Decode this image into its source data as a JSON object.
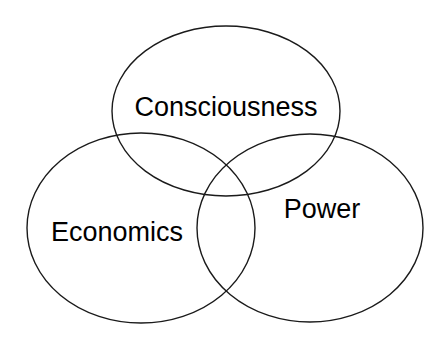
{
  "figure": {
    "type": "venn-diagram",
    "background_color": "#ffffff",
    "stroke_color": "#1a1a1a",
    "text_color": "#000000",
    "set_count": 3,
    "width": 448,
    "height": 347
  },
  "sets": [
    {
      "id": "consciousness",
      "label": "Consciousness",
      "position": "top",
      "center_x": 226,
      "center_y": 111,
      "radius_x": 114,
      "radius_y": 85,
      "label_x": 226,
      "label_y": 109
    },
    {
      "id": "economics",
      "label": "Economics",
      "position": "bottom-left",
      "center_x": 141,
      "center_y": 228,
      "radius_x": 114,
      "radius_y": 95,
      "label_x": 117,
      "label_y": 234
    },
    {
      "id": "power",
      "label": "Power",
      "position": "bottom-right",
      "center_x": 310,
      "center_y": 228,
      "radius_x": 113,
      "radius_y": 94,
      "label_x": 322,
      "label_y": 211
    }
  ]
}
